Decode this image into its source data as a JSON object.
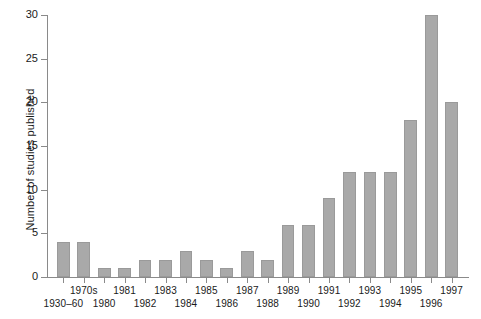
{
  "chart_data": {
    "type": "bar",
    "title": "",
    "xlabel": "",
    "ylabel": "Number of studies published",
    "ylim": [
      0,
      30
    ],
    "ytick_labels": [
      "0",
      "5",
      "10",
      "15",
      "20",
      "25",
      "30"
    ],
    "ytick_values": [
      0,
      5,
      10,
      15,
      20,
      25,
      30
    ],
    "grid": false,
    "legend": null,
    "bar_color": "#a9a9a9",
    "axis_color": "#8a8a8a",
    "text_color": "#1a1a1a",
    "categories": [
      "1930–60",
      "1970s",
      "1980",
      "1981",
      "1982",
      "1983",
      "1984",
      "1985",
      "1986",
      "1987",
      "1988",
      "1989",
      "1990",
      "1991",
      "1992",
      "1993",
      "1994",
      "1995",
      "1996",
      "1997"
    ],
    "values": [
      4,
      4,
      1,
      1,
      2,
      2,
      3,
      2,
      1,
      3,
      2,
      6,
      6,
      9,
      12,
      12,
      12,
      18,
      30,
      20
    ],
    "label_rows": [
      "bot",
      "top",
      "bot",
      "top",
      "bot",
      "top",
      "bot",
      "top",
      "bot",
      "top",
      "bot",
      "top",
      "bot",
      "top",
      "bot",
      "top",
      "bot",
      "top",
      "bot",
      "top"
    ]
  }
}
